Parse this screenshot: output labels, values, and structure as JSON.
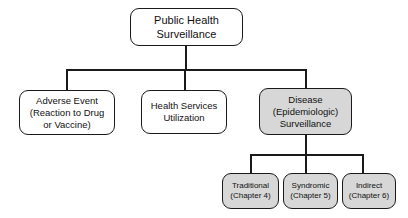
{
  "diagram": {
    "type": "tree",
    "background_color": "#ffffff",
    "line_color": "#1a1a1a",
    "shaded_fill": "#d7d7d7",
    "plain_fill": "#ffffff"
  },
  "nodes": {
    "root": {
      "name": "public-health-surveillance",
      "lines": [
        "Public Health",
        "Surveillance"
      ],
      "shaded": false
    },
    "adverse_event": {
      "name": "adverse-event",
      "lines": [
        "Adverse Event",
        "(Reaction to Drug",
        "or Vaccine)"
      ],
      "shaded": false
    },
    "health_services": {
      "name": "health-services-utilization",
      "lines": [
        "Health Services",
        "Utilization"
      ],
      "shaded": false
    },
    "disease": {
      "name": "disease-epidemiologic-surveillance",
      "lines": [
        "Disease",
        "(Epidemiologic)",
        "Surveillance"
      ],
      "shaded": true
    },
    "traditional": {
      "name": "traditional",
      "lines": [
        "Traditional",
        "(Chapter 4)"
      ],
      "shaded": true
    },
    "syndromic": {
      "name": "syndromic",
      "lines": [
        "Syndromic",
        "(Chapter 5)"
      ],
      "shaded": true
    },
    "indirect": {
      "name": "indirect",
      "lines": [
        "Indirect",
        "(Chapter 6)"
      ],
      "shaded": true
    }
  },
  "edges": [
    {
      "from": "root",
      "to": "adverse-event"
    },
    {
      "from": "root",
      "to": "health-services-utilization"
    },
    {
      "from": "root",
      "to": "disease-epidemiologic-surveillance"
    },
    {
      "from": "disease-epidemiologic-surveillance",
      "to": "traditional"
    },
    {
      "from": "disease-epidemiologic-surveillance",
      "to": "syndromic"
    },
    {
      "from": "disease-epidemiologic-surveillance",
      "to": "indirect"
    }
  ]
}
